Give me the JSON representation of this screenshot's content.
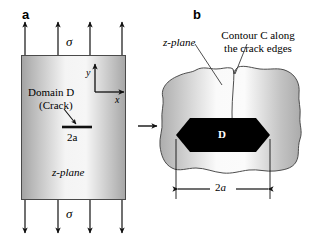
{
  "figure": {
    "panel_a": {
      "label": "a",
      "stress_top": "σ",
      "stress_bottom": "σ",
      "domain_label_line1": "Domain D",
      "domain_label_line2": "(Crack)",
      "crack_length_label": "2a",
      "plane_label": "z-plane",
      "axis_x": "x",
      "axis_y": "y",
      "arrow_count_top": 4,
      "arrow_count_bottom": 4,
      "fill_edge_color": "#a9a9a9",
      "fill_center_color": "#f2f2f2"
    },
    "panel_b": {
      "label": "b",
      "plane_label": "z-plane",
      "contour_label_line1": "Contour C along",
      "contour_label_line2": "the crack edges",
      "domain_label": "D",
      "crack_length_label": "2a",
      "domain_fill_color": "#000000",
      "blob_fill_edge_color": "#b0b0b0",
      "blob_fill_center_color": "#fbfbfb"
    },
    "transition_arrow": "→"
  }
}
